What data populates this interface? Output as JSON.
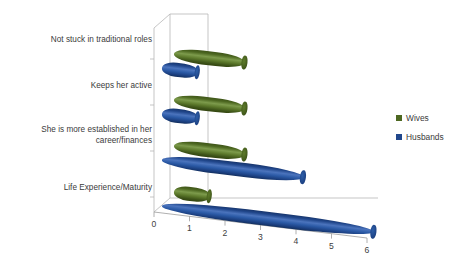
{
  "chart_data": {
    "type": "bar",
    "orientation": "horizontal",
    "style": "3d-cylinder",
    "title": "",
    "xlabel": "",
    "ylabel": "",
    "xlim": [
      0,
      6
    ],
    "xticks": [
      "0",
      "1",
      "2",
      "3",
      "4",
      "5",
      "6"
    ],
    "grid": true,
    "legend_position": "right",
    "categories": [
      "Not stuck in traditional roles",
      "Keeps her active",
      "She is more established in her career/finances",
      "Life Experience/Maturity"
    ],
    "category_lines": [
      [
        "Not stuck in traditional roles"
      ],
      [
        "Keeps her active"
      ],
      [
        "She is more established in her",
        "career/finances"
      ],
      [
        "Life Experience/Maturity"
      ]
    ],
    "series": [
      {
        "name": "Wives",
        "color": "#4d6821",
        "values": [
          2,
          2,
          2,
          1
        ]
      },
      {
        "name": "Husbands",
        "color": "#21478c",
        "values": [
          1,
          1,
          4,
          6
        ]
      }
    ]
  },
  "legend": {
    "items": [
      {
        "label": "Wives",
        "color": "#4d6821"
      },
      {
        "label": "Husbands",
        "color": "#21478c"
      }
    ]
  }
}
